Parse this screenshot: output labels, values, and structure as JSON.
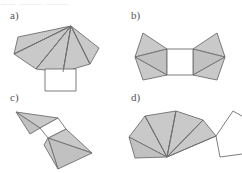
{
  "sheet": {
    "title": "Pyramid net figures a) b) c) d)",
    "background_color": "#ffffff",
    "width": 242,
    "height": 173,
    "top_artifact_text": "——  ———  ———"
  },
  "style": {
    "shaded_fill": "#c9c9c9",
    "shaded_fill_alt": "#c1c1c1",
    "white_fill": "#ffffff",
    "stroke_color": "#6e6e6e",
    "stroke_color_light": "#9a9a9a",
    "label_color": "#555555",
    "stroke_width": 0.9
  },
  "figures": [
    {
      "id": "a",
      "label": "a)",
      "description": "Fan of four shaded triangles meeting at a top apex, with a white square attached below the fan base",
      "apex": [
        71,
        19
      ],
      "fan_outer_points": [
        [
          18,
          30
        ],
        [
          14,
          47
        ],
        [
          36,
          62
        ],
        [
          63,
          65
        ],
        [
          90,
          57
        ],
        [
          99,
          41
        ]
      ],
      "square_points": [
        [
          45,
          62
        ],
        [
          76,
          62
        ],
        [
          76,
          84
        ],
        [
          45,
          84
        ]
      ],
      "fan_ribs": [
        [
          71,
          19,
          14,
          47
        ],
        [
          71,
          19,
          36,
          62
        ],
        [
          71,
          19,
          63,
          65
        ],
        [
          71,
          19,
          90,
          57
        ]
      ]
    },
    {
      "id": "b",
      "label": "b)",
      "description": "Central white square with two shaded triangular wings on the left and two on the right",
      "square_points": [
        [
          46,
          42
        ],
        [
          72,
          42
        ],
        [
          72,
          68
        ],
        [
          46,
          68
        ]
      ],
      "left_wing_upper": [
        [
          46,
          42
        ],
        [
          22,
          26
        ],
        [
          14,
          50
        ]
      ],
      "left_wing_lower": [
        [
          46,
          42
        ],
        [
          14,
          50
        ],
        [
          46,
          68
        ]
      ],
      "left_wing_tail": [
        [
          14,
          50
        ],
        [
          46,
          68
        ],
        [
          22,
          73
        ]
      ],
      "right_wing_upper": [
        [
          72,
          42
        ],
        [
          96,
          26
        ],
        [
          104,
          50
        ]
      ],
      "right_wing_lower": [
        [
          72,
          42
        ],
        [
          104,
          50
        ],
        [
          72,
          68
        ]
      ],
      "right_wing_tail": [
        [
          104,
          50
        ],
        [
          72,
          68
        ],
        [
          96,
          73
        ]
      ]
    },
    {
      "id": "c",
      "label": "c)",
      "description": "Small white quadrilateral at center with a shaded triangle pair folded up to the left and a shaded triangle pair folded down to the right",
      "center_quad": [
        [
          40,
          39
        ],
        [
          58,
          29
        ],
        [
          66,
          40
        ],
        [
          48,
          49
        ]
      ],
      "upper_left_tri_a": [
        [
          40,
          39
        ],
        [
          58,
          29
        ],
        [
          16,
          23
        ]
      ],
      "upper_left_tri_b": [
        [
          40,
          39
        ],
        [
          16,
          23
        ],
        [
          30,
          45
        ]
      ],
      "lower_right_tri_a": [
        [
          48,
          49
        ],
        [
          66,
          40
        ],
        [
          92,
          64
        ]
      ],
      "lower_right_tri_b": [
        [
          48,
          49
        ],
        [
          92,
          64
        ],
        [
          58,
          80
        ]
      ],
      "lower_right_tri_c": [
        [
          48,
          49
        ],
        [
          58,
          80
        ],
        [
          44,
          56
        ]
      ]
    },
    {
      "id": "d",
      "label": "d)",
      "description": "Fan of shaded triangles meeting at a bottom apex next to an outlined white pentagon",
      "apex": [
        46,
        68
      ],
      "fan_outer_points": [
        [
          8,
          48
        ],
        [
          24,
          27
        ],
        [
          55,
          22
        ],
        [
          82,
          31
        ],
        [
          95,
          47
        ]
      ],
      "fan_base_points": [
        [
          46,
          68
        ],
        [
          8,
          48
        ],
        [
          14,
          69
        ],
        [
          46,
          68
        ]
      ],
      "fan_ribs": [
        [
          46,
          68,
          24,
          27
        ],
        [
          46,
          68,
          55,
          22
        ],
        [
          46,
          68,
          82,
          31
        ],
        [
          46,
          68,
          95,
          47
        ]
      ],
      "pentagon_points": [
        [
          95,
          47
        ],
        [
          112,
          22
        ],
        [
          133,
          34
        ],
        [
          129,
          64
        ],
        [
          99,
          68
        ]
      ]
    }
  ]
}
